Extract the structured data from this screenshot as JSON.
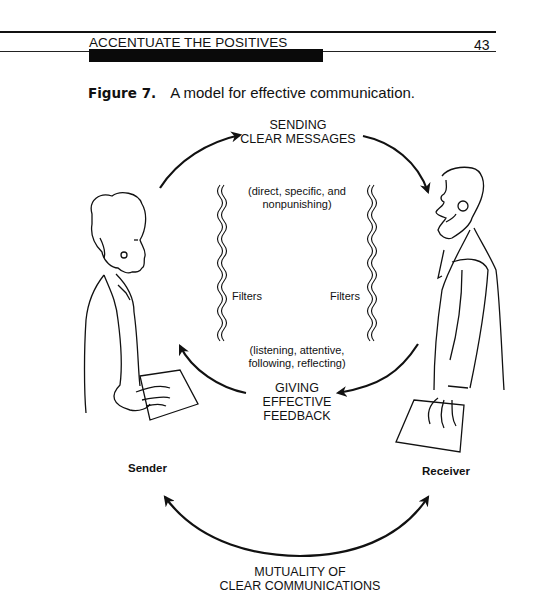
{
  "header": {
    "running_head": "ACCENTUATE THE POSITIVES",
    "page_number": "43"
  },
  "figure": {
    "number_label": "Figure 7.",
    "caption": "A model for effective communication."
  },
  "diagram": {
    "top_arrow_label": [
      "SENDING",
      "CLEAR MESSAGES"
    ],
    "top_qualifier": [
      "(direct, specific, and",
      "nonpunishing)"
    ],
    "filter_left": "Filters",
    "filter_right": "Filters",
    "bottom_qualifier": [
      "(listening, attentive,",
      "following, reflecting)"
    ],
    "feedback_label": [
      "GIVING",
      "EFFECTIVE",
      "FEEDBACK"
    ],
    "sender_label": "Sender",
    "receiver_label": "Receiver",
    "mutual_label": [
      "MUTUALITY OF",
      "CLEAR COMMUNICATIONS"
    ]
  }
}
